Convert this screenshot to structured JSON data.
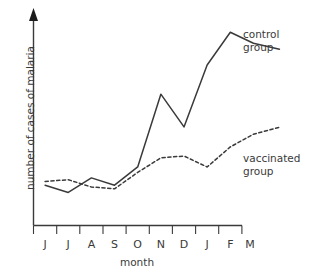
{
  "chart_data": {
    "type": "line",
    "title": "",
    "xlabel": "month",
    "ylabel": "number of cases of malaria",
    "categories": [
      "J",
      "J",
      "A",
      "S",
      "O",
      "N",
      "D",
      "J",
      "F",
      "M"
    ],
    "x_tick_labels": [
      "J",
      "J",
      "A",
      "S",
      "O",
      "N",
      "D",
      "J",
      "F",
      "M"
    ],
    "y_tick_labels": [],
    "ylim": [
      0,
      100
    ],
    "grid": false,
    "legend_position": "right-of-plot-inline-labels",
    "series": [
      {
        "name": "control group",
        "style": "solid",
        "color": "#3a3a3a",
        "values": [
          12,
          8,
          16,
          12,
          22,
          62,
          44,
          78,
          96,
          90
        ]
      },
      {
        "name": "vaccinated group",
        "style": "dashed",
        "color": "#3a3a3a",
        "values": [
          14,
          15,
          11,
          10,
          19,
          27,
          28,
          22,
          33,
          40
        ]
      }
    ],
    "annotations": [
      {
        "text": "control group",
        "target_series": "control group"
      },
      {
        "text": "vaccinated group",
        "target_series": "vaccinated group"
      }
    ]
  },
  "axes": {
    "y_axis_name": "y-axis",
    "x_axis_name": "x-axis",
    "y_arrow": "arrow-up",
    "x_label": "month",
    "y_label": "number of cases of malaria"
  },
  "labels": {
    "control_line1": "control",
    "control_line2": "group",
    "vaccinated_line1": "vaccinated",
    "vaccinated_line2": "group"
  },
  "colors": {
    "background": "#ffffff",
    "ink": "#3a3a3a",
    "arrow": "#1c1c1c"
  }
}
